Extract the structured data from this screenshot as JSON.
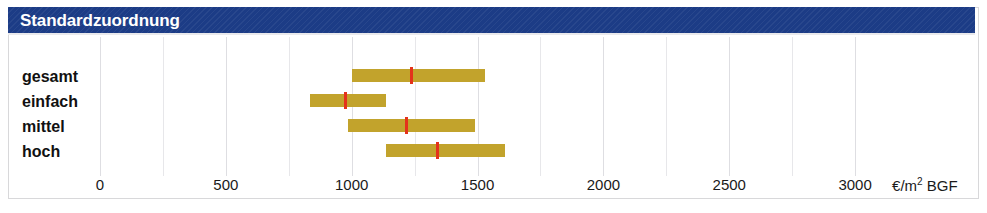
{
  "header": {
    "title": "Standardzuordnung",
    "band_color": "#1c3c86"
  },
  "chart_data": {
    "type": "bar",
    "title": "Standardzuordnung",
    "subtitle": "",
    "xlabel": "€/m² BGF",
    "ylabel": "",
    "categories": [
      "gesamt",
      "einfach",
      "mittel",
      "hoch"
    ],
    "xlim": [
      0,
      3150
    ],
    "grid": true,
    "grid_step": 250,
    "legend": "none",
    "axis_unit_text": "€/m",
    "axis_unit_sup": "2",
    "axis_unit_suffix": " BGF",
    "tick_labels": [
      "0",
      "500",
      "1000",
      "1500",
      "2000",
      "2500",
      "3000"
    ],
    "tick_values": [
      0,
      500,
      1000,
      1500,
      2000,
      2500,
      3000
    ],
    "bar_color": "#c2a32c",
    "marker_color": "#e4321b",
    "series": [
      {
        "name": "gesamt",
        "low": 1000,
        "high": 1530,
        "marker": 1235
      },
      {
        "name": "einfach",
        "low": 835,
        "high": 1135,
        "marker": 975
      },
      {
        "name": "mittel",
        "low": 985,
        "high": 1490,
        "marker": 1215
      },
      {
        "name": "hoch",
        "low": 1135,
        "high": 1610,
        "marker": 1340
      }
    ]
  }
}
